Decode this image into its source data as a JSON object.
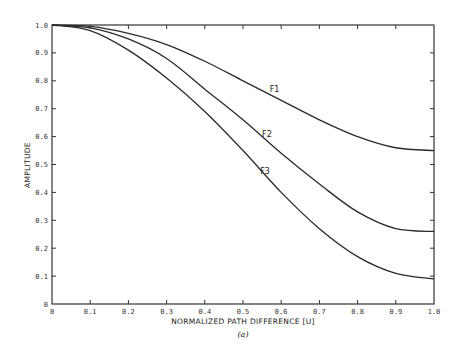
{
  "chart_data": {
    "type": "line",
    "title": "",
    "caption": "(a)",
    "xlabel": "NORMALIZED PATH DIFFERENCE [U]",
    "ylabel": "AMPLITUDE",
    "xlim": [
      0,
      1.0
    ],
    "ylim": [
      0,
      1.0
    ],
    "grid": false,
    "legend": "inline curve labels",
    "x_ticks": [
      "0",
      "0.1",
      "0.2",
      "0.3",
      "0.4",
      "0.5",
      "0.6",
      "0.7",
      "0.8",
      "0.9",
      "1.0"
    ],
    "y_ticks": [
      "0",
      "0.1",
      "0.2",
      "0.3",
      "0.4",
      "0.5",
      "0.6",
      "0.7",
      "0.8",
      "0.9",
      "1.0"
    ],
    "x": [
      0,
      0.1,
      0.2,
      0.3,
      0.4,
      0.5,
      0.6,
      0.7,
      0.8,
      0.9,
      1.0
    ],
    "series": [
      {
        "name": "F1",
        "values": [
          1.0,
          0.995,
          0.97,
          0.93,
          0.87,
          0.8,
          0.73,
          0.66,
          0.6,
          0.56,
          0.55
        ],
        "label_pos": [
          0.57,
          0.76
        ]
      },
      {
        "name": "F2",
        "values": [
          1.0,
          0.99,
          0.95,
          0.88,
          0.77,
          0.66,
          0.54,
          0.43,
          0.33,
          0.27,
          0.26
        ],
        "label_pos": [
          0.55,
          0.6
        ]
      },
      {
        "name": "F3",
        "values": [
          1.0,
          0.98,
          0.91,
          0.81,
          0.69,
          0.55,
          0.4,
          0.27,
          0.17,
          0.11,
          0.09
        ],
        "label_pos": [
          0.545,
          0.465
        ]
      }
    ]
  },
  "labels": {
    "xlabel": "NORMALIZED PATH DIFFERENCE [U]",
    "ylabel": "AMPLITUDE",
    "caption": "(a)",
    "f1": "F1",
    "f2": "F2",
    "f3": "F3"
  }
}
